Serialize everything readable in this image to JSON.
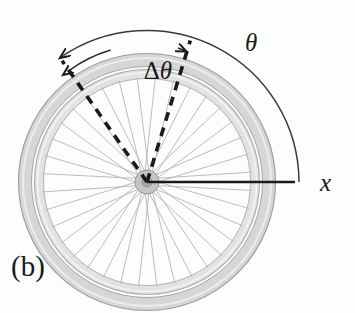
{
  "figure": {
    "panel_label": "(b)",
    "title_alt": "Bicycle wheel angular displacement diagram",
    "background_color": "#fdfdfd"
  },
  "labels": {
    "delta_theta_prefix": "Δ",
    "delta_theta_symbol": "θ",
    "delta_theta": "Δθ",
    "theta": "θ",
    "x_axis": "x"
  },
  "geometry": {
    "center_x": 147,
    "center_y": 182,
    "tire_outer_radius": 123,
    "tire_inner_radius": 112,
    "rim_radius": 104,
    "hub_radius": 13,
    "spoke_count": 36,
    "dashed_line_angle_start_deg": 125,
    "dashed_line_angle_end_deg": 73,
    "dashed_line_length": 148,
    "x_axis_end_x": 295,
    "delta_theta_arc_radius": 136,
    "theta_arc_radius": 152,
    "theta_arc_start_deg": 125,
    "theta_arc_end_deg": 0
  },
  "colors": {
    "line_dark": "#1a1a1a",
    "tire_fill": "#dcdcdc",
    "tire_stroke": "#9a9a9a",
    "rim_fill": "#efefef",
    "rim_stroke": "#a8a8a8",
    "spoke": "#b4b4b4",
    "hub_fill": "#bfbfbf",
    "hub_stroke": "#8f8f8f",
    "dashed": "#1a1a1a",
    "arc": "#3a3a3a"
  },
  "annotations": {
    "delta_theta_arc_arrowheads": 2,
    "theta_arc_arrowheads": 1,
    "dashed_lines": 2
  }
}
